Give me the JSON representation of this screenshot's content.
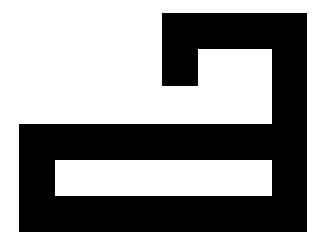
{
  "figure": {
    "background_color": "#ffffff",
    "shape_color": "#000000"
  }
}
